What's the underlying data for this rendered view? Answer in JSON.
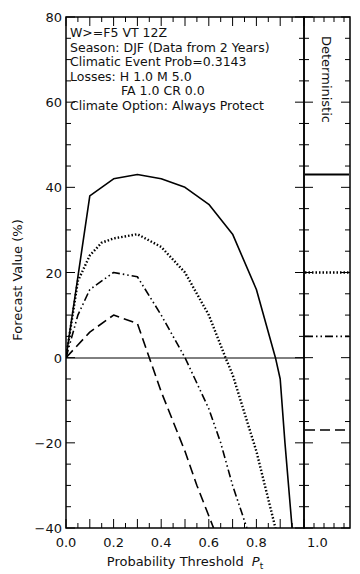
{
  "chart_data": {
    "type": "line",
    "title": "",
    "xlabel": "Probability Threshold P_t",
    "xlabel_main": "Probability Threshold",
    "xlabel_symbol": "P",
    "xlabel_subscript": "t",
    "ylabel": "Forecast Value (%)",
    "xlim": [
      0.0,
      1.0
    ],
    "ylim": [
      -40,
      80
    ],
    "x_ticks": [
      "0.0",
      "0.2",
      "0.4",
      "0.6",
      "0.8",
      "1.0"
    ],
    "y_ticks": [
      "-40",
      "-20",
      "0",
      "20",
      "40",
      "60",
      "80"
    ],
    "grid": false,
    "annotations": [
      "W>=F5        VT 12Z",
      "Season: DJF (Data from 2 Years)",
      "Climatic Event Prob=0.3143",
      "Losses: H    1.0 M    5.0",
      "FA  1.0 CR  0.0",
      "Climate Option: Always Protect"
    ],
    "side_panel": {
      "label": "Deterministic",
      "x_tick": "1.0",
      "values": [
        {
          "style": "solid",
          "value": 43
        },
        {
          "style": "dotted",
          "value": 20
        },
        {
          "style": "dash-dot-dot",
          "value": 5
        },
        {
          "style": "dashed",
          "value": -17
        }
      ]
    },
    "series": [
      {
        "name": "solid",
        "style": "solid",
        "x": [
          0.0,
          0.1,
          0.2,
          0.3,
          0.4,
          0.5,
          0.6,
          0.7,
          0.8,
          0.88,
          0.9,
          0.92,
          0.95
        ],
        "y": [
          0,
          38,
          42,
          43,
          42,
          40,
          36,
          29,
          16,
          0,
          -5,
          -20,
          -40
        ]
      },
      {
        "name": "dotted",
        "style": "dotted",
        "x": [
          0.0,
          0.05,
          0.1,
          0.15,
          0.2,
          0.3,
          0.4,
          0.5,
          0.6,
          0.67,
          0.7,
          0.8,
          0.88
        ],
        "y": [
          0,
          18,
          24,
          27,
          28,
          29,
          26,
          20,
          10,
          0,
          -4,
          -22,
          -40
        ]
      },
      {
        "name": "dash-dot-dot",
        "style": "dash-dot-dot",
        "x": [
          0.0,
          0.05,
          0.1,
          0.2,
          0.3,
          0.4,
          0.5,
          0.6,
          0.65,
          0.7,
          0.76
        ],
        "y": [
          0,
          10,
          16,
          20,
          19,
          10,
          0,
          -12,
          -20,
          -30,
          -40
        ]
      },
      {
        "name": "dashed",
        "style": "dashed",
        "x": [
          0.0,
          0.1,
          0.2,
          0.3,
          0.35,
          0.4,
          0.5,
          0.55,
          0.62
        ],
        "y": [
          0,
          6,
          10,
          8,
          0,
          -8,
          -22,
          -30,
          -40
        ]
      }
    ]
  }
}
